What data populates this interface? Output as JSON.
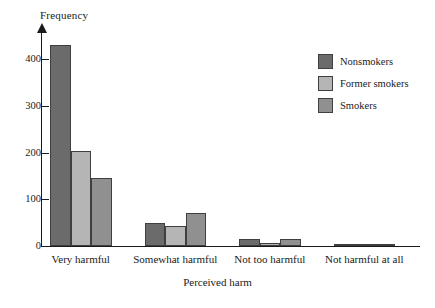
{
  "chart_data": {
    "type": "bar",
    "title": "",
    "xlabel": "Perceived harm",
    "ylabel": "Frequency",
    "categories": [
      "Very harmful",
      "Somewhat harmful",
      "Not too harmful",
      "Not harmful at all"
    ],
    "series": [
      {
        "name": "Nonsmokers",
        "color": "#6b6b6b",
        "values": [
          430,
          49,
          14,
          3
        ]
      },
      {
        "name": "Former smokers",
        "color": "#b5b5b5",
        "values": [
          203,
          42,
          7,
          2
        ]
      },
      {
        "name": "Smokers",
        "color": "#909090",
        "values": [
          145,
          70,
          14,
          4
        ]
      }
    ],
    "ylim": [
      0,
      460
    ],
    "yticks": [
      0,
      100,
      200,
      300,
      400
    ],
    "ytick_labels": [
      "0",
      "100",
      "200",
      "300",
      "400"
    ],
    "grid": false,
    "legend_position": "top-right",
    "axis_color": "#1a1a1a",
    "bar_border_color": "#3f3f3f"
  }
}
